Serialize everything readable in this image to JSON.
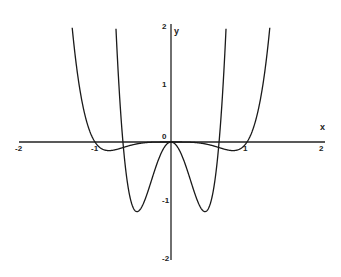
{
  "chart_data": {
    "type": "line",
    "title": "",
    "xlabel": "x",
    "ylabel": "y",
    "xlim": [
      -2,
      2
    ],
    "ylim": [
      -2,
      2
    ],
    "grid": false,
    "legend": null,
    "x_ticks": [
      -2,
      -1,
      0,
      1,
      2
    ],
    "x_tick_labels": [
      "-2",
      "-1",
      "0",
      "1",
      "2"
    ],
    "y_ticks": [
      -2,
      -1,
      1,
      2
    ],
    "y_tick_labels": [
      "-2",
      "-1",
      "1",
      "2"
    ],
    "origin_label": "0",
    "series": [
      {
        "name": "f(x) = x^6 - x^4",
        "formula": "x^6 - x^4",
        "roots": [
          -1,
          0,
          1
        ],
        "local_minima": [
          [
            -0.816,
            -0.148
          ],
          [
            0.816,
            -0.148
          ]
        ],
        "x": [
          -1.25,
          -1.2,
          -1.1,
          -1.0,
          -0.9,
          -0.816,
          -0.7,
          -0.5,
          -0.3,
          0,
          0.3,
          0.5,
          0.7,
          0.816,
          0.9,
          1.0,
          1.1,
          1.2,
          1.25
        ],
        "values": [
          1.43,
          0.91,
          0.31,
          0.0,
          -0.12,
          -0.148,
          -0.12,
          -0.047,
          -0.007,
          0,
          -0.007,
          -0.047,
          -0.12,
          -0.148,
          -0.12,
          0.0,
          0.31,
          0.91,
          1.43
        ]
      },
      {
        "name": "f''(x) = 30x^4 - 12x^2",
        "formula": "30x^4 - 12x^2",
        "roots": [
          -0.632,
          0,
          0.632
        ],
        "local_minima": [
          [
            -0.447,
            -1.2
          ],
          [
            0.447,
            -1.2
          ]
        ],
        "x": [
          -0.71,
          -0.65,
          -0.632,
          -0.55,
          -0.447,
          -0.35,
          -0.2,
          0,
          0.2,
          0.35,
          0.447,
          0.55,
          0.632,
          0.65,
          0.71
        ],
        "values": [
          1.92,
          0.3,
          0.0,
          -0.88,
          -1.2,
          -1.02,
          -0.43,
          0,
          -0.43,
          -1.02,
          -1.2,
          -0.88,
          0.0,
          0.3,
          1.92
        ]
      }
    ]
  },
  "layout": {
    "origin_px": [
      171,
      142
    ],
    "x_unit_px": 76,
    "y_unit_px": 58
  }
}
